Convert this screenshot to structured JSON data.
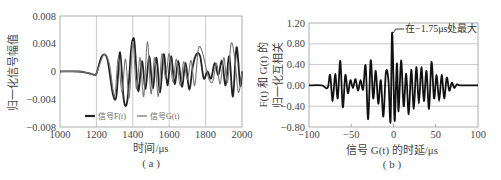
{
  "figure": {
    "panel_a": {
      "caption": "( a )",
      "xlabel": "时间/μs",
      "ylabel": "归一化信号幅值",
      "legend": [
        {
          "label": "信号F(t)",
          "color": "#222222",
          "width": 2.0
        },
        {
          "label": "信号G(t)",
          "color": "#777777",
          "width": 1.2
        }
      ]
    },
    "panel_b": {
      "caption": "( b )",
      "xlabel": "信号 G(t) 的时延/μs",
      "ylabel_line1": "F(t) 和 G(t) 的",
      "ylabel_line2": "归一化互相关",
      "annotation": "在−1.75μs处最大"
    }
  },
  "chart_data": [
    {
      "type": "line",
      "title": "( a )",
      "xlabel": "时间/μs",
      "ylabel": "归一化信号幅值",
      "xlim": [
        1000,
        2000
      ],
      "ylim": [
        -0.008,
        0.008
      ],
      "xticks": [
        1000,
        1200,
        1400,
        1600,
        1800,
        2000
      ],
      "yticks": [
        -0.008,
        -0.004,
        0,
        0.004,
        0.008
      ],
      "ytick_labels": [
        "−0.008",
        "−0.004",
        "0",
        "0.004",
        "0.008"
      ],
      "grid": "vertical",
      "legend_position": "lower center",
      "series": [
        {
          "name": "信号F(t)",
          "color": "#222222",
          "x": [
            1000,
            1100,
            1150,
            1180,
            1200,
            1230,
            1260,
            1290,
            1310,
            1330,
            1350,
            1370,
            1390,
            1400,
            1410,
            1430,
            1450,
            1470,
            1490,
            1510,
            1530,
            1550,
            1570,
            1590,
            1610,
            1630,
            1650,
            1670,
            1690,
            1710,
            1730,
            1750,
            1770,
            1790,
            1810,
            1830,
            1850,
            1870,
            1890,
            1910,
            1930,
            1950,
            1970,
            1990,
            2000
          ],
          "y": [
            0,
            0,
            -0.0002,
            -0.0004,
            -0.0003,
            0.0022,
            0.0018,
            -0.0032,
            -0.0035,
            0.0028,
            -0.004,
            -0.0042,
            0.003,
            0.0046,
            0.004,
            -0.0028,
            0.0015,
            -0.0025,
            0.0022,
            -0.0024,
            0.002,
            -0.003,
            0.0025,
            -0.002,
            0.0022,
            -0.0018,
            0.0015,
            -0.0022,
            0.0012,
            -0.0026,
            0.0008,
            0.0025,
            0.0022,
            -0.001,
            0.0,
            -0.001,
            0.0012,
            -0.0005,
            0.0015,
            -0.002,
            0.0022,
            -0.0036,
            0.0035,
            -0.002,
            0.0
          ]
        },
        {
          "name": "信号G(t)",
          "color": "#777777",
          "x": [
            1000,
            1100,
            1150,
            1180,
            1200,
            1240,
            1270,
            1300,
            1320,
            1340,
            1360,
            1380,
            1400,
            1420,
            1440,
            1460,
            1480,
            1500,
            1520,
            1540,
            1560,
            1580,
            1600,
            1620,
            1640,
            1660,
            1680,
            1700,
            1720,
            1740,
            1760,
            1780,
            1800,
            1820,
            1840,
            1860,
            1880,
            1900,
            1920,
            1940,
            1960,
            1980,
            2000
          ],
          "y": [
            0,
            0,
            -0.0002,
            -0.0004,
            -0.0003,
            0.0024,
            0.0012,
            -0.0035,
            0.002,
            -0.003,
            0.0018,
            -0.0038,
            0.0043,
            -0.0025,
            0.002,
            -0.0036,
            0.0043,
            -0.0032,
            0.002,
            -0.0036,
            0.0025,
            -0.001,
            0.0026,
            -0.0015,
            0.0018,
            -0.002,
            0.0014,
            -0.0012,
            0.0016,
            -0.002,
            0.0032,
            0.003,
            0.0008,
            -0.0012,
            -0.0014,
            0.0012,
            -0.0018,
            0.002,
            -0.0016,
            0.004,
            0.002,
            -0.003,
            0.0
          ]
        }
      ]
    },
    {
      "type": "line",
      "title": "( b )",
      "xlabel": "信号 G(t) 的时延/μs",
      "ylabel": "F(t) 和 G(t) 的归一化互相关",
      "xlim": [
        -100,
        100
      ],
      "ylim": [
        -0.8,
        1.2
      ],
      "xticks": [
        -100,
        -50,
        0,
        50,
        100
      ],
      "yticks": [
        -0.8,
        -0.4,
        0.0,
        0.4,
        0.8,
        1.2
      ],
      "ytick_labels": [
        "−0.80",
        "−0.40",
        "0.00",
        "0.40",
        "0.80",
        "1.20"
      ],
      "grid": "horizontal",
      "annotation": {
        "text": "在−1.75μs处最大",
        "x": -1.75,
        "y": 1.0
      },
      "series": [
        {
          "name": "F(t) 和 G(t) 的归一化互相关",
          "color": "#111111",
          "x": [
            -100,
            -85,
            -78,
            -75,
            -72,
            -69,
            -66,
            -63,
            -60,
            -57,
            -54,
            -51,
            -48,
            -45,
            -42,
            -39,
            -36,
            -33,
            -30,
            -27,
            -24,
            -21,
            -18,
            -15,
            -12,
            -9,
            -6,
            -3.5,
            -1.75,
            0,
            1.5,
            4,
            6,
            9,
            12,
            15,
            18,
            21,
            24,
            27,
            30,
            33,
            36,
            39,
            42,
            45,
            48,
            51,
            54,
            57,
            60,
            63,
            66,
            69,
            72,
            75,
            78,
            85,
            100
          ],
          "y": [
            0,
            0,
            -0.05,
            0.2,
            -0.3,
            0.22,
            -0.25,
            0.47,
            -0.42,
            0.2,
            -0.15,
            0.1,
            -0.05,
            0.12,
            -0.1,
            0.1,
            -0.08,
            0.38,
            -0.65,
            0.48,
            -0.25,
            0.28,
            -0.35,
            0.1,
            -0.6,
            0.25,
            0.1,
            -0.7,
            1.0,
            0.1,
            -0.68,
            0.42,
            -0.5,
            0.48,
            -0.4,
            0.22,
            -0.55,
            0.3,
            -0.45,
            0.35,
            -0.35,
            0.35,
            -0.3,
            0.28,
            -0.45,
            0.45,
            -0.25,
            0.2,
            -0.3,
            0.2,
            -0.25,
            0.15,
            -0.1,
            0.05,
            -0.05,
            0.02,
            0,
            0,
            0
          ]
        }
      ]
    }
  ]
}
